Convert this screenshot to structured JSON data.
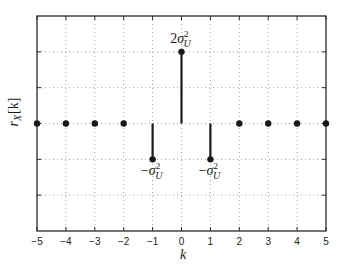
{
  "chart_data": {
    "type": "stem",
    "title": "",
    "xlabel": "k",
    "ylabel": "r_X[k]",
    "x": [
      -5,
      -4,
      -3,
      -2,
      -1,
      0,
      1,
      2,
      3,
      4,
      5
    ],
    "values": [
      0,
      0,
      0,
      0,
      -1,
      2,
      -1,
      0,
      0,
      0,
      0
    ],
    "value_units": "sigma_U^2",
    "xlim": [
      -5,
      5
    ],
    "ylim": [
      -3,
      3
    ],
    "xticks": [
      -5,
      -4,
      -3,
      -2,
      -1,
      0,
      1,
      2,
      3,
      4,
      5
    ],
    "xtick_labels": [
      "−5",
      "−4",
      "−3",
      "−2",
      "−1",
      "0",
      "1",
      "2",
      "3",
      "4",
      "5"
    ],
    "yticks": [
      -2,
      -1,
      0,
      1,
      2
    ],
    "ytick_labels": [],
    "grid": true,
    "grid_style": "dotted",
    "legend": null,
    "annotations": [
      {
        "x": 0,
        "y": 2,
        "text": "2σ_U^2",
        "prefix": "2",
        "position": "above"
      },
      {
        "x": -1,
        "y": -1,
        "text": "−σ_U^2",
        "prefix": "−",
        "position": "below"
      },
      {
        "x": 1,
        "y": -1,
        "text": "−σ_U^2",
        "prefix": "−",
        "position": "below"
      }
    ],
    "colors": {
      "stem": "#1a1a1a",
      "marker": "#1a1a1a",
      "axes": "#2a2a2a",
      "grid": "#8a8a8a",
      "background": "#ffffff"
    }
  },
  "labels": {
    "xlabel": "k",
    "ylabel_main": "r",
    "ylabel_sub": "X",
    "ylabel_arg": "[k]",
    "sigma": "σ",
    "sub": "U",
    "sup": "2"
  }
}
